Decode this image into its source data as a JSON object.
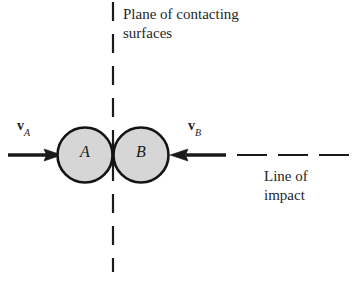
{
  "figure": {
    "background_color": "#ffffff",
    "stroke_color": "#1a1a1a",
    "body_fill_color": "#d6d6d6",
    "labels": {
      "plane_line1": "Plane of contacting",
      "plane_line2": "surfaces",
      "line_of_impact_line1": "Line of",
      "line_of_impact_line2": "impact",
      "velocity_a_symbol": "v",
      "velocity_a_subscript": "A",
      "velocity_b_symbol": "v",
      "velocity_b_subscript": "B",
      "body_a": "A",
      "body_b": "B"
    },
    "geometry": {
      "body_a_center_x": 85,
      "body_a_center_y": 155,
      "body_a_radius": 28,
      "body_b_center_x": 141,
      "body_b_center_y": 155,
      "body_b_radius": 28,
      "plane_line_x": 113,
      "plane_line_top": 2,
      "plane_line_bottom": 272,
      "impact_axis_y": 155,
      "arrow_a_start_x": 8,
      "arrow_a_end_x": 60,
      "arrow_b_start_x": 226,
      "arrow_b_end_x": 170,
      "impact_dash_start_x": 237,
      "impact_dash_end_x": 356
    }
  }
}
